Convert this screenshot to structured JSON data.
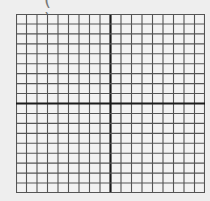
{
  "figure": {
    "label_fragment": "( )",
    "grid": {
      "columns": 18,
      "rows": 18,
      "x_axis_row_index": 9,
      "y_axis_col_index": 9,
      "line_color": "#555555",
      "axis_color": "#1a1a1a",
      "background": "#eeeeee"
    }
  }
}
